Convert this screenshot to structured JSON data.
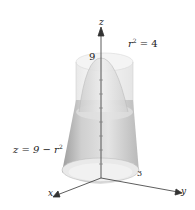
{
  "figure": {
    "type": "3d-surface-diagram",
    "labels": {
      "z_axis": "z",
      "x_axis": "x",
      "y_axis": "y",
      "z_intercept": "9",
      "y_tick": "3",
      "cylinder_eq_base": "r",
      "cylinder_eq_exp": "2",
      "cylinder_eq_rest": " = 4",
      "paraboloid_eq_base": "z = 9 − r",
      "paraboloid_eq_exp": "2"
    },
    "surfaces": [
      {
        "name": "cylinder",
        "equation": "r^2 = 4"
      },
      {
        "name": "paraboloid",
        "equation": "z = 9 - r^2"
      }
    ],
    "colors": {
      "surface_light": "#f0f0f0",
      "surface_mid": "#d6d6d6",
      "surface_dark": "#a8a8a8",
      "axis": "#333333"
    }
  }
}
